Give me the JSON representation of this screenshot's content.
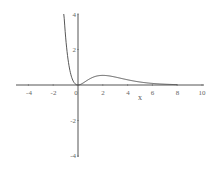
{
  "chart_data": {
    "type": "line",
    "title": "",
    "function": "x^2*exp(-x)",
    "xlabel": "x",
    "ylabel": "",
    "xlim": [
      -5,
      10
    ],
    "ylim": [
      -4,
      4
    ],
    "grid": false,
    "x_ticks": [
      -4,
      -2,
      0,
      2,
      4,
      6,
      8,
      10
    ],
    "y_ticks": [
      -4,
      -2,
      2,
      4
    ],
    "series": [
      {
        "name": "y",
        "color": "#444444",
        "x": [
          -1.15,
          -1.0,
          -0.8,
          -0.6,
          -0.4,
          -0.2,
          0,
          0.5,
          1,
          1.5,
          2,
          2.5,
          3,
          4,
          5,
          6,
          7,
          8
        ],
        "y": [
          4.0,
          2.72,
          1.42,
          0.66,
          0.24,
          0.05,
          0,
          0.15,
          0.37,
          0.5,
          0.54,
          0.51,
          0.45,
          0.29,
          0.17,
          0.09,
          0.04,
          0.02
        ]
      }
    ]
  },
  "axes": {
    "x_label": "x",
    "x_tick_labels": [
      "-4",
      "-2",
      "0",
      "2",
      "4",
      "6",
      "8",
      "10"
    ],
    "y_tick_labels": [
      "4",
      "2",
      "-2",
      "-4"
    ]
  },
  "colors": {
    "axis": "#555555",
    "curve": "#444444",
    "background": "#ffffff"
  }
}
